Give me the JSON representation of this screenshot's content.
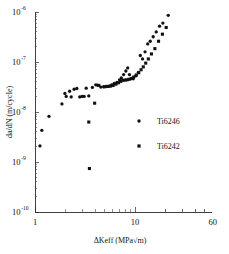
{
  "chart_data": {
    "type": "scatter",
    "title": "",
    "xlabel": "ΔKeff (MPa√m)",
    "ylabel": "da/dN (m/cycle)",
    "xscale": "log",
    "yscale": "log",
    "xlim": [
      1,
      60
    ],
    "ylim": [
      1e-10,
      1e-06
    ],
    "grid": false,
    "legend_position": "center-right",
    "xticks": [
      {
        "value": 1,
        "label": "1"
      },
      {
        "value": 10,
        "label": "10"
      },
      {
        "value": 60,
        "label": "60"
      }
    ],
    "yticks": [
      {
        "value": 1e-06,
        "mantissa": "10",
        "exponent": "-6"
      },
      {
        "value": 1e-07,
        "mantissa": "10",
        "exponent": "-7"
      },
      {
        "value": 1e-08,
        "mantissa": "10",
        "exponent": "-8"
      },
      {
        "value": 1e-09,
        "mantissa": "10",
        "exponent": "-9"
      },
      {
        "value": 1e-10,
        "mantissa": "10",
        "exponent": "-10"
      }
    ],
    "series": [
      {
        "name": "Ti6246",
        "marker": "circle",
        "color": "#111111",
        "points": [
          [
            1.12,
            2.1e-09
          ],
          [
            1.17,
            4.3e-09
          ],
          [
            1.38,
            8.2e-09
          ],
          [
            1.86,
            1.45e-08
          ],
          [
            1.99,
            2.35e-08
          ],
          [
            2.05,
            2.05e-08
          ],
          [
            2.22,
            2.6e-08
          ],
          [
            2.3,
            2e-08
          ],
          [
            2.46,
            2.85e-08
          ],
          [
            2.62,
            2.95e-08
          ],
          [
            2.8,
            2e-08
          ],
          [
            2.95,
            2.05e-08
          ],
          [
            3.1,
            2.05e-08
          ],
          [
            3.25,
            3e-08
          ],
          [
            3.45,
            2.1e-08
          ],
          [
            3.75,
            3.1e-08
          ],
          [
            4.05,
            3.5e-08
          ],
          [
            4.2,
            3.45e-08
          ],
          [
            4.55,
            3.15e-08
          ],
          [
            4.85,
            3.2e-08
          ],
          [
            5.15,
            3.25e-08
          ],
          [
            5.5,
            3.3e-08
          ],
          [
            5.85,
            3.5e-08
          ],
          [
            6.2,
            3.75e-08
          ],
          [
            6.6,
            3.9e-08
          ],
          [
            7.0,
            4.4e-08
          ],
          [
            7.3,
            4.8e-08
          ],
          [
            7.7,
            5.6e-08
          ],
          [
            8.1,
            6.6e-08
          ],
          [
            8.45,
            7.6e-08
          ],
          [
            8.8,
            5.6e-08
          ],
          [
            9.1,
            4.6e-08
          ],
          [
            9.6,
            4.6e-08
          ],
          [
            10.2,
            5.3e-08
          ],
          [
            10.8,
            6.2e-08
          ],
          [
            11.3,
            1.35e-07
          ],
          [
            11.9,
            1.15e-07
          ],
          [
            12.6,
            1.6e-07
          ],
          [
            13.4,
            2.3e-07
          ],
          [
            14.2,
            2.6e-07
          ],
          [
            15.2,
            3.2e-07
          ],
          [
            16.3,
            4e-07
          ],
          [
            17.6,
            5.2e-07
          ],
          [
            19.0,
            6e-07
          ],
          [
            21.5,
            8.6e-07
          ]
        ]
      },
      {
        "name": "Ti6242",
        "marker": "square",
        "color": "#111111",
        "points": [
          [
            3.45,
            6.3e-09
          ],
          [
            3.5,
            7.4e-10
          ],
          [
            3.95,
            1.5e-08
          ],
          [
            4.35,
            3.4e-08
          ],
          [
            5.0,
            3.2e-08
          ],
          [
            5.35,
            3.25e-08
          ],
          [
            5.7,
            3.3e-08
          ],
          [
            6.05,
            3.4e-08
          ],
          [
            6.45,
            3.6e-08
          ],
          [
            6.85,
            3.85e-08
          ],
          [
            7.2,
            4.1e-08
          ],
          [
            7.55,
            4.3e-08
          ],
          [
            7.95,
            4.35e-08
          ],
          [
            8.3,
            4.4e-08
          ],
          [
            8.7,
            4.5e-08
          ],
          [
            9.2,
            4.7e-08
          ],
          [
            9.7,
            5e-08
          ],
          [
            10.3,
            5.5e-08
          ],
          [
            10.9,
            6.1e-08
          ],
          [
            11.5,
            7e-08
          ],
          [
            12.1,
            8e-08
          ],
          [
            12.8,
            9.5e-08
          ],
          [
            13.6,
            1.15e-07
          ],
          [
            14.6,
            1.45e-07
          ],
          [
            15.8,
            1.85e-07
          ],
          [
            17.2,
            2.6e-07
          ],
          [
            18.8,
            3.6e-07
          ],
          [
            20.5,
            4.9e-07
          ]
        ]
      }
    ],
    "legend": [
      {
        "label": "Ti6246",
        "marker": "circle"
      },
      {
        "label": "Ti6242",
        "marker": "square"
      }
    ]
  }
}
